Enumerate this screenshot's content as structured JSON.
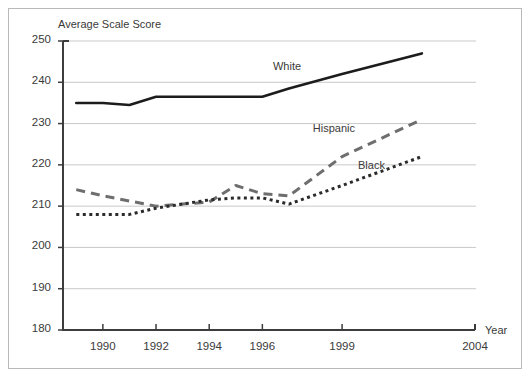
{
  "figure": {
    "y_axis_title": "Average Scale Score",
    "x_axis_title": "Year"
  },
  "chart_data": {
    "type": "line",
    "title": "",
    "subtitle": "",
    "xlabel": "Year",
    "ylabel": "Average Scale Score",
    "xlim": [
      1988.5,
      2004
    ],
    "ylim": [
      180,
      250
    ],
    "ytick_labels": [
      "180",
      "190",
      "200",
      "210",
      "220",
      "230",
      "240",
      "250"
    ],
    "ytick_values": [
      180,
      190,
      200,
      210,
      220,
      230,
      240,
      250
    ],
    "xtick_labels": [
      "1990",
      "1992",
      "1994",
      "1996",
      "1999",
      "2004"
    ],
    "xtick_values": [
      1990,
      1992,
      1994,
      1996,
      1999,
      2004
    ],
    "grid": "horizontal",
    "legend_position": "inline-annotations",
    "series": [
      {
        "name": "White",
        "style": "solid",
        "color": "#1c1c1c",
        "x": [
          1989,
          1990,
          1991,
          1992,
          1994,
          1996,
          1997,
          1999,
          2002
        ],
        "values": [
          235,
          235,
          234.5,
          236.5,
          236.5,
          236.5,
          238.5,
          242,
          247
        ]
      },
      {
        "name": "Hispanic",
        "style": "dashed",
        "color": "#6e6e6e",
        "x": [
          1989,
          1990,
          1992,
          1994,
          1995,
          1996,
          1997,
          1999,
          2002
        ],
        "values": [
          214,
          212.5,
          210,
          211,
          215,
          213,
          212.5,
          222,
          231
        ]
      },
      {
        "name": "Black",
        "style": "dotted",
        "color": "#2b2b2b",
        "x": [
          1989,
          1990,
          1991,
          1992,
          1994,
          1995,
          1996,
          1997,
          1999,
          2002
        ],
        "values": [
          208,
          208,
          208,
          209.5,
          211.5,
          212,
          212,
          210.5,
          215,
          222
        ]
      }
    ],
    "annotations": [
      {
        "text": "White",
        "x": 1996.4,
        "y": 243.5
      },
      {
        "text": "Hispanic",
        "x": 1997.9,
        "y": 228.5
      },
      {
        "text": "Black",
        "x": 1999.6,
        "y": 219.5
      }
    ]
  }
}
